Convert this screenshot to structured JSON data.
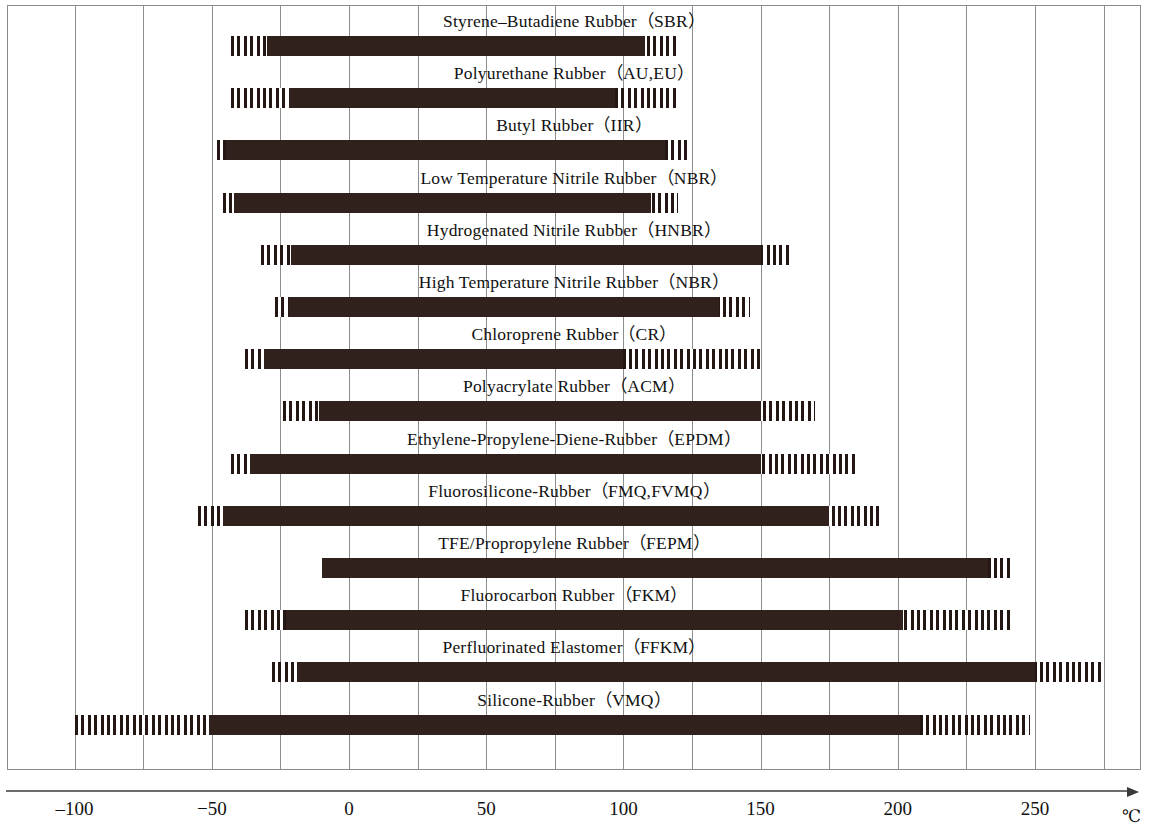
{
  "chart_data": {
    "type": "bar",
    "title": "",
    "subtitle": "",
    "xlabel": "",
    "ylabel": "",
    "axis_unit": "℃",
    "xlim": [
      -120,
      285
    ],
    "grid": true,
    "grid_step": 25,
    "legend": [],
    "x_ticks": [
      {
        "value": -100,
        "label": "–100"
      },
      {
        "value": -50,
        "label": "−50"
      },
      {
        "value": 0,
        "label": "0"
      },
      {
        "value": 50,
        "label": "50"
      },
      {
        "value": 100,
        "label": "100"
      },
      {
        "value": 150,
        "label": "150"
      },
      {
        "value": 200,
        "label": "200"
      },
      {
        "value": 250,
        "label": "250"
      }
    ],
    "gridline_values": [
      -125,
      -100,
      -75,
      -50,
      -25,
      0,
      25,
      50,
      75,
      100,
      125,
      150,
      175,
      200,
      225,
      250,
      275
    ],
    "series_note": "solid = standard service range, hatched = extended / intermittent range",
    "categories": [
      "Styrene–Butadiene Rubber（SBR）",
      "Polyurethane Rubber（AU,EU）",
      "Butyl Rubber（IIR）",
      "Low Temperature Nitrile Rubber（NBR）",
      "Hydrogenated Nitrile Rubber（HNBR）",
      "High Temperature Nitrile Rubber（NBR）",
      "Chloroprene Rubber（CR）",
      "Polyacrylate Rubber（ACM）",
      "Ethylene-Propylene-Diene-Rubber（EPDM）",
      "Fluorosilicone-Rubber（FMQ,FVMQ）",
      "TFE/Propropylene Rubber（FEPM）",
      "Fluorocarbon Rubber（FKM）",
      "Perfluorinated Elastomer（FFKM）",
      "Silicone-Rubber（VMQ）"
    ],
    "rows": [
      {
        "label": "Styrene–Butadiene Rubber（SBR）",
        "hatch_min": -43,
        "solid_min": -30,
        "solid_max": 108,
        "hatch_max": 119
      },
      {
        "label": "Polyurethane Rubber（AU,EU）",
        "hatch_min": -43,
        "solid_min": -22,
        "solid_max": 97,
        "hatch_max": 119
      },
      {
        "label": "Butyl Rubber（IIR）",
        "hatch_min": -48,
        "solid_min": -45,
        "solid_max": 115,
        "hatch_max": 124
      },
      {
        "label": "Low Temperature Nitrile Rubber（NBR）",
        "hatch_min": -46,
        "solid_min": -42,
        "solid_max": 110,
        "hatch_max": 120
      },
      {
        "label": "Hydrogenated Nitrile Rubber（HNBR）",
        "hatch_min": -32,
        "solid_min": -21,
        "solid_max": 150,
        "hatch_max": 161
      },
      {
        "label": "High Temperature Nitrile Rubber（NBR）",
        "hatch_min": -27,
        "solid_min": -22,
        "solid_max": 135,
        "hatch_max": 146
      },
      {
        "label": "Chloroprene Rubber（CR）",
        "hatch_min": -38,
        "solid_min": -31,
        "solid_max": 100,
        "hatch_max": 150
      },
      {
        "label": "Polyacrylate Rubber（ACM）",
        "hatch_min": -24,
        "solid_min": -11,
        "solid_max": 150,
        "hatch_max": 170
      },
      {
        "label": "Ethylene-Propylene-Diene-Rubber（EPDM）",
        "hatch_min": -43,
        "solid_min": -36,
        "solid_max": 150,
        "hatch_max": 185
      },
      {
        "label": "Fluorosilicone-Rubber（FMQ,FVMQ）",
        "hatch_min": -55,
        "solid_min": -46,
        "solid_max": 175,
        "hatch_max": 193
      },
      {
        "label": "TFE/Propropylene Rubber（FEPM）",
        "hatch_min": -10,
        "solid_min": -10,
        "solid_max": 233,
        "hatch_max": 242
      },
      {
        "label": "Fluorocarbon Rubber（FKM）",
        "hatch_min": -38,
        "solid_min": -23,
        "solid_max": 202,
        "hatch_max": 242
      },
      {
        "label": "Perfluorinated Elastomer（FFKM）",
        "hatch_min": -28,
        "solid_min": -19,
        "solid_max": 250,
        "hatch_max": 275
      },
      {
        "label": "Silicone-Rubber（VMQ）",
        "hatch_min": -100,
        "solid_min": -51,
        "solid_max": 208,
        "hatch_max": 248
      }
    ]
  },
  "colors": {
    "bar": "#30211c",
    "hatch": "#241713",
    "grid": "#8e8e8e",
    "frame": "#8b8b8b",
    "axis": "#6d6d6d",
    "text": "#111111",
    "background": "#ffffff"
  }
}
